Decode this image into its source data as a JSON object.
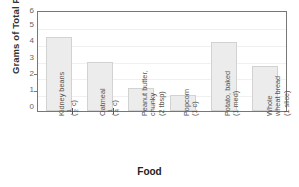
{
  "chart_data": {
    "type": "bar",
    "title": "",
    "xlabel": "Food",
    "ylabel": "Grams of Total Fiber",
    "ylim": [
      0,
      6
    ],
    "yticks": [
      0,
      1,
      2,
      3,
      4,
      5,
      6
    ],
    "grid": true,
    "legend": false,
    "categories": [
      "Kidney beans (1/2 c)",
      "Oatmeal (1/4 c)",
      "Peanut butter, chunky (2 tbsp)",
      "Popcorn (1 c)",
      "Potato, baked (1 med)",
      "Whole wheat bread (1 slice)"
    ],
    "category_parts": [
      {
        "name": "Kidney beans",
        "amount_num": "1",
        "amount_den": "2",
        "amount_unit": "c",
        "amount_plain": ""
      },
      {
        "name": "Oatmeal",
        "amount_num": "1",
        "amount_den": "4",
        "amount_unit": "c",
        "amount_plain": ""
      },
      {
        "name": "Peanut butter,",
        "name2": "chunky",
        "amount_num": "",
        "amount_den": "",
        "amount_unit": "",
        "amount_plain": "(2 tbsp)"
      },
      {
        "name": "Popcorn",
        "amount_num": "",
        "amount_den": "",
        "amount_unit": "",
        "amount_plain": "(1 c)"
      },
      {
        "name": "Potato, baked",
        "amount_num": "",
        "amount_den": "",
        "amount_unit": "",
        "amount_plain": "(1 med)"
      },
      {
        "name": "Whole",
        "name2": "wheat bread",
        "amount_num": "",
        "amount_den": "",
        "amount_unit": "",
        "amount_plain": "(1 slice)"
      }
    ],
    "values": [
      4.5,
      3.0,
      1.4,
      1.0,
      4.2,
      2.7
    ],
    "bar_color": "#ececec",
    "bar_edge_color": "#d2d2d2"
  }
}
